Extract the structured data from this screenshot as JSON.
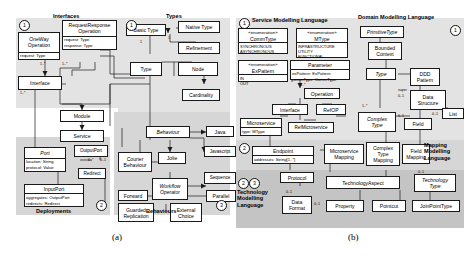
{
  "figure": {
    "label_a": "(a)",
    "label_b": "(b)"
  },
  "panel_a": {
    "sections": [
      {
        "key": "interfaces",
        "title": "Interfaces",
        "number": "1"
      },
      {
        "key": "types",
        "title": "Types",
        "number": "1"
      },
      {
        "key": "deployments",
        "title": "Deployments",
        "number": "2"
      },
      {
        "key": "behaviours",
        "title": "Behaviours",
        "number": "3"
      }
    ],
    "classes": [
      {
        "name": "OneWay\nOperation",
        "attrs": [
          "request: Type"
        ]
      },
      {
        "name": "RequestResponse\nOperation",
        "attrs": [
          "request: Type",
          "response: Type"
        ]
      },
      {
        "name": "Interface",
        "attrs": []
      },
      {
        "name": "Module",
        "attrs": []
      },
      {
        "name": "Service",
        "attrs": []
      },
      {
        "name": "Basic Type",
        "attrs": []
      },
      {
        "name": "Native Type",
        "attrs": []
      },
      {
        "name": "Refinement",
        "attrs": []
      },
      {
        "name": "Type",
        "attrs": []
      },
      {
        "name": "Node",
        "attrs": []
      },
      {
        "name": "Cardinality",
        "attrs": []
      },
      {
        "name": "Port",
        "attrs": [
          "location: String",
          "protocol: Value"
        ],
        "italic": true
      },
      {
        "name": "OutputPort",
        "attrs": []
      },
      {
        "name": "Redirect",
        "attrs": []
      },
      {
        "name": "InputPort",
        "attrs": [
          "aggregates: OutputPort",
          "redirects: Redirect"
        ]
      },
      {
        "name": "Behaviour",
        "attrs": [],
        "italic": true
      },
      {
        "name": "Java",
        "attrs": []
      },
      {
        "name": "Javascript",
        "attrs": []
      },
      {
        "name": "Courier\nBehaviour",
        "attrs": []
      },
      {
        "name": "Jolie",
        "attrs": []
      },
      {
        "name": "Workflow\nOperator",
        "attrs": [],
        "italic": true
      },
      {
        "name": "Sequence",
        "attrs": []
      },
      {
        "name": "Parallel",
        "attrs": []
      },
      {
        "name": "Forward",
        "attrs": []
      },
      {
        "name": "Guarded\nReplication",
        "attrs": []
      },
      {
        "name": "External\nChoice",
        "attrs": []
      }
    ],
    "labels": {
      "oneway_operation": "OneWay\nOperation",
      "oneway_attr": "request: Type",
      "reqresp_operation": "RequestResponse\nOperation",
      "reqresp_attr1": "request: Type",
      "reqresp_attr2": "response: Type",
      "interface": "Interface",
      "module": "Module",
      "service": "Service",
      "basic_type": "Basic Type",
      "native_type": "Native Type",
      "refinement": "Refinement",
      "type": "Type",
      "node": "Node",
      "cardinality": "Cardinality",
      "port": "Port",
      "port_attr1": "location: String",
      "port_attr2": "protocol: Value",
      "output_port": "OutputPort",
      "redirect": "Redirect",
      "input_port": "InputPort",
      "input_attr1": "aggregates: OutputPort",
      "input_attr2": "redirects: Redirect",
      "behaviour": "Behaviour",
      "java": "Java",
      "javascript": "Javascript",
      "courier_behaviour": "Courier\nBehaviour",
      "jolie": "Jolie",
      "workflow_operator": "Workflow\nOperator",
      "sequence": "Sequence",
      "parallel": "Parallel",
      "forward": "Forward",
      "guarded_replication": "Guarded\nReplication",
      "external_choice": "External\nChoice",
      "interfaces_caption": "Interfaces",
      "types_caption": "Types",
      "deployments_caption": "Deployments",
      "behaviours_caption": "Behaviours",
      "num1a": "1",
      "num1b": "1",
      "num2": "2",
      "num3": "3"
    }
  },
  "panel_b": {
    "sections": [
      {
        "key": "service_ml",
        "title": "Service Modelling Language",
        "number": "1"
      },
      {
        "key": "domain_ml",
        "title": "Domain Modelling Language",
        "number": "1"
      },
      {
        "key": "mapping_ml",
        "title": "Mapping\nModelling\nLanguage",
        "number": "2"
      },
      {
        "key": "technology_ml",
        "title": "Technology\nModelling\nLanguage",
        "numbers": [
          "2",
          "3"
        ]
      }
    ],
    "labels": {
      "service_ml_caption": "Service Modelling Language",
      "domain_ml_caption": "Domain Modelling Language",
      "mapping_ml_caption": "Mapping\nModelling\nLanguage",
      "technology_ml_caption": "Technology\nModelling\nLanguage",
      "stereotype": "«enumeration»",
      "commtype": "CommType",
      "commtype_vals": "SYNCHRONOUS\nASYNCHRONOUS",
      "mtype": "MType",
      "mtype_vals": "INFRASTRUCTURE\nUTILITY\nFUNCTIONAL",
      "expattern": "ExPattern",
      "expattern_vals": "IN\nOUT",
      "parameter": "Parameter",
      "parameter_attr1": "exPattern: ExPattern",
      "parameter_attr2": "commType: CommType",
      "operation": "Operation",
      "interface": "Interface",
      "refop": "RefOP",
      "microservice": "Microservice",
      "microservice_attr": "type: MType",
      "refmicroservice": "RefMicroservice",
      "endpoint": "Endpoint",
      "endpoint_attr": "addresses: String[1..*]",
      "microservice_mapping": "Microservice\nMapping",
      "protocol": "Protocol",
      "data_format": "Data\nFormat",
      "primitive_type": "PrimitiveType",
      "bounded_context": "Bounded\nContext",
      "type": "Type",
      "ddd_pattern": "DDD\nPattern",
      "data_structure": "Data\nStructure",
      "complex_type": "Complex\nType",
      "field": "Field",
      "list": "List",
      "complex_type_mapping": "Complex\nType\nMapping",
      "field_mapping": "Field\nMapping",
      "technology_aspect": "TechnologyAspect",
      "technology_type": "Technology\nType",
      "property": "Property",
      "pointcut": "Pointcut",
      "joinpointtype": "JoinPointType",
      "num1a": "1",
      "num1b": "1",
      "num2a": "2",
      "num2b": "2",
      "num3": "3"
    }
  },
  "multiplicities": {
    "m_1": "1",
    "m_1s": "1..*",
    "m_0s": "0..*",
    "m_01": "0..1",
    "m_super": "super",
    "m_01b": "0..1"
  },
  "colors": {
    "band": "#d6d6d6",
    "band_light": "#e3e3e3",
    "band_dark": "#c4c4c4",
    "line": "#1a1a1a",
    "box_fill": "#ffffff"
  }
}
